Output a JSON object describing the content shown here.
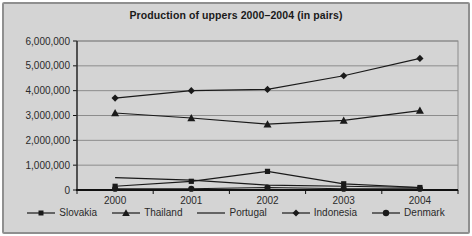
{
  "window": {
    "background": "#d4d4d4",
    "frame_border": "#8f8f8f",
    "line_color": "#1a1a1a",
    "grid_color": "#8c8c8c",
    "axis_color": "#111111"
  },
  "chart_data": {
    "type": "line",
    "title": "Production of uppers 2000–2004 (in pairs)",
    "categories": [
      "2000",
      "2001",
      "2002",
      "2003",
      "2004"
    ],
    "series": [
      {
        "name": "Slovakia",
        "marker": "square",
        "values": [
          150000,
          350000,
          750000,
          250000,
          100000
        ]
      },
      {
        "name": "Thailand",
        "marker": "triangle",
        "values": [
          3100000,
          2900000,
          2650000,
          2800000,
          3200000
        ]
      },
      {
        "name": "Portugal",
        "marker": "none",
        "values": [
          500000,
          400000,
          200000,
          150000,
          100000
        ]
      },
      {
        "name": "Indonesia",
        "marker": "diamond",
        "values": [
          3700000,
          4000000,
          4050000,
          4600000,
          5300000
        ]
      },
      {
        "name": "Denmark",
        "marker": "circle",
        "values": [
          50000,
          50000,
          100000,
          50000,
          50000
        ]
      }
    ],
    "ylim": [
      0,
      6000000
    ],
    "ytick_step": 1000000,
    "ytick_labels": [
      "0",
      "1,000,000",
      "2,000,000",
      "3,000,000",
      "4,000,000",
      "5,000,000",
      "6,000,000"
    ],
    "xlabel": "",
    "ylabel": "",
    "grid": true,
    "legend_position": "bottom"
  }
}
